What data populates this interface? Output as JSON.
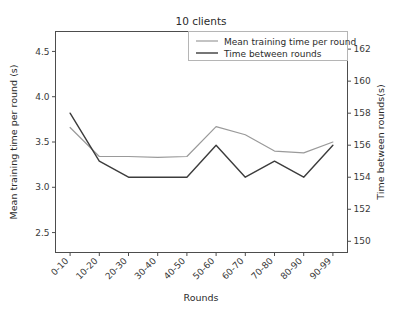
{
  "chart_data": {
    "type": "line",
    "title": "10 clients",
    "xlabel": "Rounds",
    "ylabel": "Mean training time per round (s)",
    "y2label": "Time between rounds(s)",
    "categories": [
      "0-10",
      "10-20",
      "20-30",
      "30-40",
      "40-50",
      "50-60",
      "60-70",
      "70-80",
      "80-90",
      "90-99"
    ],
    "xtick_rotation": "45",
    "grid": "off",
    "legend_position": "upper right",
    "ylim": [
      2.28,
      4.72
    ],
    "y2lim": [
      149.3,
      163.1
    ],
    "yticks": [
      "2.5",
      "3.0",
      "3.5",
      "4.0",
      "4.5"
    ],
    "ytick_values": [
      2.5,
      3.0,
      3.5,
      4.0,
      4.5
    ],
    "y2ticks": [
      "150",
      "152",
      "154",
      "156",
      "158",
      "160",
      "162"
    ],
    "y2tick_values": [
      150,
      152,
      154,
      156,
      158,
      160,
      162
    ],
    "series": [
      {
        "name": "Mean training time per round",
        "axis": "left",
        "color": "#9a9a9a",
        "values": [
          3.66,
          3.34,
          3.34,
          3.33,
          3.34,
          3.67,
          3.58,
          3.4,
          3.38,
          3.5
        ]
      },
      {
        "name": "Time between rounds",
        "axis": "right",
        "color": "#3c3c3c",
        "values": [
          158,
          155,
          154,
          154,
          154,
          156,
          154,
          155,
          154,
          156
        ]
      }
    ]
  },
  "legend": {
    "entries": [
      {
        "label": "Mean training time per round",
        "color": "#9a9a9a"
      },
      {
        "label": "Time between rounds",
        "color": "#3c3c3c"
      }
    ]
  },
  "colors": {
    "axis": "#4d4d4d",
    "text": "#2b2b2b",
    "background": "#ffffff",
    "series_gray": "#9a9a9a",
    "series_dark": "#3c3c3c"
  }
}
